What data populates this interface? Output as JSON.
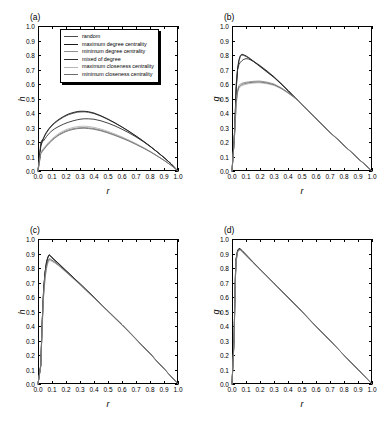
{
  "figure": {
    "width": 388,
    "height": 427,
    "background": "#ffffff"
  },
  "legend": {
    "position": "panel-a-top-left",
    "entries": [
      {
        "label": "random",
        "color": "#4a4a4a"
      },
      {
        "label": "maximum degree centrality",
        "color": "#1a1a1a"
      },
      {
        "label": "minimum degree centrality",
        "color": "#8f8f8f"
      },
      {
        "label": "mixed of degree",
        "color": "#2e2e2e"
      },
      {
        "label": "maximum closeness centrality",
        "color": "#b4b4b4"
      },
      {
        "label": "minimum closeness centrality",
        "color": "#6e6e6e"
      }
    ]
  },
  "axis_ticks": {
    "values": [
      "0.0",
      "0.1",
      "0.2",
      "0.3",
      "0.4",
      "0.5",
      "0.6",
      "0.7",
      "0.8",
      "0.9",
      "1.0"
    ]
  },
  "chart_data": [
    {
      "id": "a",
      "type": "line",
      "panel_label": "(a)",
      "title": "",
      "xlabel": "r",
      "ylabel": "h",
      "xlim": [
        0.0,
        1.0
      ],
      "ylim": [
        0.0,
        1.0
      ],
      "grid": false,
      "legend_position": "upper left inside",
      "x": [
        0.0,
        0.02,
        0.03,
        0.04,
        0.05,
        0.06,
        0.08,
        0.1,
        0.12,
        0.15,
        0.18,
        0.2,
        0.22,
        0.25,
        0.28,
        0.3,
        0.33,
        0.36,
        0.4,
        0.45,
        0.5,
        0.55,
        0.6,
        0.65,
        0.7,
        0.75,
        0.8,
        0.85,
        0.9,
        0.95,
        1.0
      ],
      "series": [
        {
          "name": "random",
          "color": "#4a4a4a",
          "values": [
            0.0,
            0.17,
            0.2,
            0.225,
            0.245,
            0.262,
            0.29,
            0.312,
            0.33,
            0.352,
            0.37,
            0.38,
            0.389,
            0.398,
            0.405,
            0.407,
            0.408,
            0.405,
            0.396,
            0.378,
            0.355,
            0.33,
            0.302,
            0.272,
            0.24,
            0.206,
            0.17,
            0.132,
            0.092,
            0.05,
            0.0
          ]
        },
        {
          "name": "maximum degree centrality",
          "color": "#1a1a1a",
          "values": [
            0.0,
            0.175,
            0.205,
            0.23,
            0.25,
            0.267,
            0.295,
            0.317,
            0.335,
            0.357,
            0.375,
            0.385,
            0.394,
            0.403,
            0.41,
            0.412,
            0.412,
            0.409,
            0.4,
            0.381,
            0.358,
            0.332,
            0.304,
            0.274,
            0.242,
            0.208,
            0.172,
            0.133,
            0.093,
            0.05,
            0.0
          ]
        },
        {
          "name": "minimum degree centrality",
          "color": "#8f8f8f",
          "values": [
            0.0,
            0.125,
            0.138,
            0.15,
            0.163,
            0.175,
            0.196,
            0.215,
            0.232,
            0.253,
            0.268,
            0.277,
            0.284,
            0.292,
            0.297,
            0.299,
            0.3,
            0.298,
            0.293,
            0.282,
            0.267,
            0.25,
            0.231,
            0.21,
            0.187,
            0.162,
            0.135,
            0.105,
            0.074,
            0.04,
            0.0
          ]
        },
        {
          "name": "mixed of degree",
          "color": "#2e2e2e",
          "values": [
            0.0,
            0.195,
            0.215,
            0.208,
            0.222,
            0.237,
            0.26,
            0.278,
            0.292,
            0.308,
            0.322,
            0.33,
            0.337,
            0.346,
            0.353,
            0.357,
            0.36,
            0.36,
            0.357,
            0.346,
            0.33,
            0.311,
            0.288,
            0.263,
            0.235,
            0.204,
            0.17,
            0.133,
            0.093,
            0.05,
            0.0
          ]
        },
        {
          "name": "maximum closeness centrality",
          "color": "#b4b4b4",
          "values": [
            0.0,
            0.13,
            0.145,
            0.158,
            0.17,
            0.182,
            0.203,
            0.222,
            0.239,
            0.26,
            0.276,
            0.285,
            0.292,
            0.3,
            0.306,
            0.308,
            0.309,
            0.307,
            0.301,
            0.289,
            0.273,
            0.255,
            0.235,
            0.213,
            0.189,
            0.163,
            0.136,
            0.106,
            0.074,
            0.04,
            0.0
          ]
        },
        {
          "name": "minimum closeness centrality",
          "color": "#6e6e6e",
          "values": [
            0.0,
            0.12,
            0.133,
            0.146,
            0.158,
            0.17,
            0.191,
            0.21,
            0.227,
            0.248,
            0.263,
            0.272,
            0.279,
            0.287,
            0.292,
            0.294,
            0.295,
            0.293,
            0.288,
            0.277,
            0.262,
            0.245,
            0.226,
            0.206,
            0.183,
            0.159,
            0.133,
            0.104,
            0.073,
            0.04,
            0.0
          ]
        }
      ]
    },
    {
      "id": "b",
      "type": "line",
      "panel_label": "(b)",
      "title": "",
      "xlabel": "r",
      "ylabel": "g",
      "xlim": [
        0.0,
        1.0
      ],
      "ylim": [
        0.0,
        1.0
      ],
      "grid": false,
      "x": [
        0.0,
        0.015,
        0.02,
        0.03,
        0.04,
        0.05,
        0.06,
        0.07,
        0.08,
        0.1,
        0.12,
        0.15,
        0.18,
        0.2,
        0.25,
        0.3,
        0.35,
        0.4,
        0.45,
        0.5,
        0.6,
        0.7,
        0.8,
        0.9,
        1.0
      ],
      "series": [
        {
          "name": "random",
          "color": "#4a4a4a",
          "values": [
            0.0,
            0.205,
            0.3,
            0.56,
            0.7,
            0.76,
            0.79,
            0.8,
            0.798,
            0.79,
            0.778,
            0.757,
            0.735,
            0.72,
            0.682,
            0.645,
            0.6,
            0.553,
            0.505,
            0.455,
            0.36,
            0.266,
            0.176,
            0.087,
            0.0
          ]
        },
        {
          "name": "maximum degree centrality",
          "color": "#1a1a1a",
          "values": [
            0.0,
            0.21,
            0.31,
            0.57,
            0.71,
            0.768,
            0.797,
            0.805,
            0.803,
            0.794,
            0.782,
            0.76,
            0.738,
            0.723,
            0.685,
            0.647,
            0.602,
            0.555,
            0.506,
            0.456,
            0.361,
            0.267,
            0.177,
            0.087,
            0.0
          ]
        },
        {
          "name": "minimum degree centrality",
          "color": "#8f8f8f",
          "values": [
            0.0,
            0.2,
            0.28,
            0.48,
            0.56,
            0.59,
            0.6,
            0.605,
            0.608,
            0.612,
            0.615,
            0.618,
            0.62,
            0.62,
            0.613,
            0.6,
            0.575,
            0.543,
            0.505,
            0.46,
            0.363,
            0.268,
            0.177,
            0.087,
            0.0
          ]
        },
        {
          "name": "mixed of degree",
          "color": "#2e2e2e",
          "values": [
            0.0,
            0.207,
            0.305,
            0.6,
            0.7,
            0.735,
            0.75,
            0.76,
            0.768,
            0.775,
            0.772,
            0.758,
            0.74,
            0.727,
            0.69,
            0.65,
            0.604,
            0.556,
            0.507,
            0.457,
            0.362,
            0.267,
            0.177,
            0.087,
            0.0
          ]
        },
        {
          "name": "maximum closeness centrality",
          "color": "#b4b4b4",
          "values": [
            0.0,
            0.195,
            0.27,
            0.46,
            0.54,
            0.57,
            0.582,
            0.588,
            0.592,
            0.598,
            0.602,
            0.606,
            0.608,
            0.608,
            0.602,
            0.59,
            0.568,
            0.538,
            0.502,
            0.458,
            0.362,
            0.267,
            0.177,
            0.087,
            0.0
          ]
        },
        {
          "name": "minimum closeness centrality",
          "color": "#6e6e6e",
          "values": [
            0.0,
            0.198,
            0.275,
            0.47,
            0.55,
            0.58,
            0.59,
            0.596,
            0.6,
            0.605,
            0.609,
            0.612,
            0.614,
            0.614,
            0.607,
            0.595,
            0.571,
            0.54,
            0.503,
            0.459,
            0.362,
            0.267,
            0.177,
            0.087,
            0.0
          ]
        }
      ]
    },
    {
      "id": "c",
      "type": "line",
      "panel_label": "(c)",
      "title": "",
      "xlabel": "r",
      "ylabel": "h",
      "xlim": [
        0.0,
        1.0
      ],
      "ylim": [
        0.0,
        1.0
      ],
      "grid": false,
      "x": [
        0.0,
        0.02,
        0.03,
        0.04,
        0.05,
        0.06,
        0.07,
        0.08,
        0.09,
        0.1,
        0.12,
        0.15,
        0.2,
        0.25,
        0.3,
        0.35,
        0.4,
        0.45,
        0.5,
        0.6,
        0.7,
        0.8,
        0.9,
        0.95,
        1.0
      ],
      "series": [
        {
          "name": "random",
          "color": "#4a4a4a",
          "values": [
            0.0,
            0.13,
            0.42,
            0.64,
            0.76,
            0.83,
            0.87,
            0.888,
            0.88,
            0.87,
            0.852,
            0.826,
            0.78,
            0.735,
            0.69,
            0.643,
            0.597,
            0.55,
            0.503,
            0.408,
            0.31,
            0.209,
            0.105,
            0.053,
            0.0
          ]
        },
        {
          "name": "maximum degree centrality",
          "color": "#1a1a1a",
          "values": [
            0.0,
            0.135,
            0.43,
            0.65,
            0.77,
            0.838,
            0.875,
            0.892,
            0.884,
            0.873,
            0.855,
            0.829,
            0.782,
            0.737,
            0.692,
            0.645,
            0.598,
            0.551,
            0.504,
            0.409,
            0.311,
            0.21,
            0.105,
            0.053,
            0.0
          ]
        },
        {
          "name": "minimum degree centrality",
          "color": "#8f8f8f",
          "values": [
            0.0,
            0.125,
            0.4,
            0.61,
            0.73,
            0.8,
            0.84,
            0.858,
            0.856,
            0.85,
            0.838,
            0.816,
            0.773,
            0.73,
            0.686,
            0.64,
            0.594,
            0.548,
            0.501,
            0.407,
            0.309,
            0.209,
            0.105,
            0.053,
            0.0
          ]
        },
        {
          "name": "mixed of degree",
          "color": "#2e2e2e",
          "values": [
            0.0,
            0.132,
            0.425,
            0.645,
            0.765,
            0.834,
            0.872,
            0.89,
            0.882,
            0.871,
            0.853,
            0.827,
            0.781,
            0.736,
            0.691,
            0.644,
            0.597,
            0.55,
            0.503,
            0.408,
            0.31,
            0.209,
            0.105,
            0.053,
            0.0
          ]
        },
        {
          "name": "maximum closeness centrality",
          "color": "#b4b4b4",
          "values": [
            0.0,
            0.122,
            0.395,
            0.6,
            0.72,
            0.792,
            0.832,
            0.85,
            0.85,
            0.845,
            0.834,
            0.813,
            0.771,
            0.728,
            0.684,
            0.638,
            0.593,
            0.547,
            0.5,
            0.406,
            0.309,
            0.208,
            0.105,
            0.053,
            0.0
          ]
        },
        {
          "name": "minimum closeness centrality",
          "color": "#6e6e6e",
          "values": [
            0.0,
            0.128,
            0.41,
            0.62,
            0.74,
            0.81,
            0.848,
            0.864,
            0.861,
            0.854,
            0.841,
            0.819,
            0.775,
            0.731,
            0.687,
            0.641,
            0.595,
            0.549,
            0.502,
            0.407,
            0.31,
            0.209,
            0.105,
            0.053,
            0.0
          ]
        }
      ]
    },
    {
      "id": "d",
      "type": "line",
      "panel_label": "(d)",
      "title": "",
      "xlabel": "r",
      "ylabel": "g",
      "xlim": [
        0.0,
        1.0
      ],
      "ylim": [
        0.0,
        1.0
      ],
      "grid": false,
      "x": [
        0.0,
        0.015,
        0.02,
        0.025,
        0.03,
        0.04,
        0.05,
        0.06,
        0.07,
        0.08,
        0.1,
        0.15,
        0.2,
        0.3,
        0.4,
        0.5,
        0.6,
        0.7,
        0.8,
        0.9,
        1.0
      ],
      "series": [
        {
          "name": "random",
          "color": "#4a4a4a",
          "values": [
            0.0,
            0.31,
            0.56,
            0.76,
            0.86,
            0.918,
            0.932,
            0.928,
            0.92,
            0.91,
            0.89,
            0.84,
            0.792,
            0.695,
            0.597,
            0.498,
            0.398,
            0.299,
            0.199,
            0.099,
            0.0
          ]
        },
        {
          "name": "maximum degree centrality",
          "color": "#1a1a1a",
          "values": [
            0.0,
            0.32,
            0.575,
            0.772,
            0.868,
            0.922,
            0.935,
            0.931,
            0.922,
            0.912,
            0.892,
            0.842,
            0.793,
            0.696,
            0.598,
            0.499,
            0.399,
            0.299,
            0.199,
            0.099,
            0.0
          ]
        },
        {
          "name": "minimum degree centrality",
          "color": "#8f8f8f",
          "values": [
            0.0,
            0.3,
            0.545,
            0.745,
            0.85,
            0.91,
            0.926,
            0.924,
            0.916,
            0.907,
            0.887,
            0.838,
            0.79,
            0.694,
            0.596,
            0.497,
            0.398,
            0.298,
            0.199,
            0.099,
            0.0
          ]
        },
        {
          "name": "mixed of degree",
          "color": "#2e2e2e",
          "values": [
            0.0,
            0.315,
            0.565,
            0.765,
            0.863,
            0.92,
            0.933,
            0.929,
            0.921,
            0.911,
            0.891,
            0.841,
            0.792,
            0.695,
            0.597,
            0.498,
            0.398,
            0.299,
            0.199,
            0.099,
            0.0
          ]
        },
        {
          "name": "maximum closeness centrality",
          "color": "#b4b4b4",
          "values": [
            0.0,
            0.295,
            0.538,
            0.738,
            0.845,
            0.906,
            0.923,
            0.922,
            0.914,
            0.905,
            0.885,
            0.836,
            0.789,
            0.693,
            0.595,
            0.497,
            0.397,
            0.298,
            0.199,
            0.099,
            0.0
          ]
        },
        {
          "name": "minimum closeness centrality",
          "color": "#6e6e6e",
          "values": [
            0.0,
            0.305,
            0.552,
            0.752,
            0.855,
            0.913,
            0.928,
            0.926,
            0.918,
            0.908,
            0.888,
            0.839,
            0.791,
            0.694,
            0.596,
            0.498,
            0.398,
            0.299,
            0.199,
            0.099,
            0.0
          ]
        }
      ]
    }
  ]
}
